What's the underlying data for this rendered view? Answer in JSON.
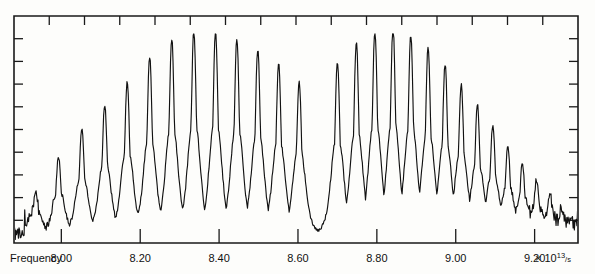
{
  "figure": {
    "background_color": "#fdfdfb",
    "trace_color": "#121212",
    "frame_color": "#1a1a1a"
  },
  "axes": {
    "x_axis_title": "Frequency",
    "x_axis_units": "× 10",
    "x_axis_units_exponent": "13",
    "x_axis_units_denominator": "/s",
    "x_tick_labels": [
      "8.00",
      "8.20",
      "8.40",
      "8.60",
      "8.80",
      "9.00",
      "9.20"
    ],
    "x_tick_values": [
      8.0,
      8.2,
      8.4,
      8.6,
      8.8,
      9.0,
      9.2
    ],
    "y_tick_labels": [],
    "minor_ticks_top": 16,
    "minor_ticks_left": 10,
    "minor_ticks_right": 10,
    "frame": {
      "left": 14,
      "top": 16,
      "right": 578,
      "bottom": 243
    }
  },
  "chart_data": {
    "type": "line",
    "title": "",
    "subtitle": "",
    "xlabel": "Frequency",
    "ylabel": "",
    "xlim": [
      7.88,
      9.31
    ],
    "ylim": [
      0,
      1
    ],
    "grid": false,
    "legend": null,
    "annotations": [],
    "x_units_factor": 10000000000000.0,
    "x_units_label": "× 10^13 /s",
    "series": [
      {
        "name": "transmission",
        "line_positions": [
          7.935,
          7.993,
          8.052,
          8.11,
          8.167,
          8.224,
          8.28,
          8.336,
          8.391,
          8.445,
          8.498,
          8.551,
          8.603,
          8.7,
          8.748,
          8.795,
          8.841,
          8.886,
          8.93,
          8.973,
          9.014,
          9.055,
          9.094,
          9.132,
          9.169,
          9.205,
          9.239,
          9.268,
          9.292
        ],
        "line_peak_heights": [
          0.22,
          0.38,
          0.52,
          0.63,
          0.74,
          0.86,
          0.95,
          0.99,
          0.98,
          0.95,
          0.9,
          0.83,
          0.74,
          0.84,
          0.93,
          0.99,
          1.0,
          0.97,
          0.91,
          0.83,
          0.73,
          0.63,
          0.53,
          0.43,
          0.34,
          0.26,
          0.19,
          0.14,
          0.1
        ],
        "baseline_level": 0.04,
        "noise_amplitude": 0.02
      }
    ],
    "branch_gap": {
      "center": 8.63,
      "width": 0.08,
      "label": ""
    }
  }
}
